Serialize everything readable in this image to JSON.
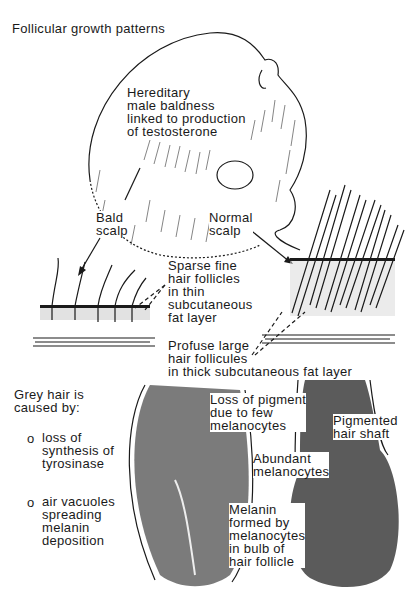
{
  "title": "Follicular growth patterns",
  "head_section": {
    "main_label": "Hereditary\nmale baldness\nlinked to production\nof testosterone",
    "bald_label": "Bald\nscalp",
    "normal_label": "Normal\nscalp"
  },
  "scalp_section": {
    "sparse_label": "Sparse fine\nhair follicles\nin thin\nsubcutaneous\nfat layer",
    "profuse_label": "Profuse large\nhair follicules\nin thick subcutaneous fat layer"
  },
  "grey_section": {
    "heading": "Grey hair is\ncaused by:",
    "causes": [
      {
        "bullet": "o",
        "text": "loss of\nsynthesis of\ntyrosinase"
      },
      {
        "bullet": "o",
        "text": "air vacuoles\nspreading\nmelanin\ndeposition"
      }
    ],
    "loss_pigment_label": "Loss of pigment\ndue to few\nmelanocytes",
    "pigmented_shaft_label": "Pigmented\nhair shaft",
    "abundant_label": "Abundant\nmelanocytes",
    "melanin_label": "Melanin\nformed by\nmelanocytes\nin bulb of\nhair follicle"
  }
}
